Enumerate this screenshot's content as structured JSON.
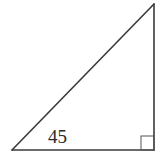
{
  "diagram": {
    "type": "right-triangle",
    "vertices": {
      "bottom_left": [
        12,
        150
      ],
      "bottom_right": [
        154,
        150
      ],
      "top": [
        154,
        4
      ]
    },
    "right_angle_marker": {
      "x": 141,
      "y": 136,
      "size": 14
    },
    "labels": [
      {
        "text": "45",
        "x": 48,
        "y": 143,
        "describes": "base side length"
      }
    ],
    "colors": {
      "background": "#ffffff",
      "stroke": "#3a3a3a",
      "text": "#2a2a2a"
    }
  }
}
